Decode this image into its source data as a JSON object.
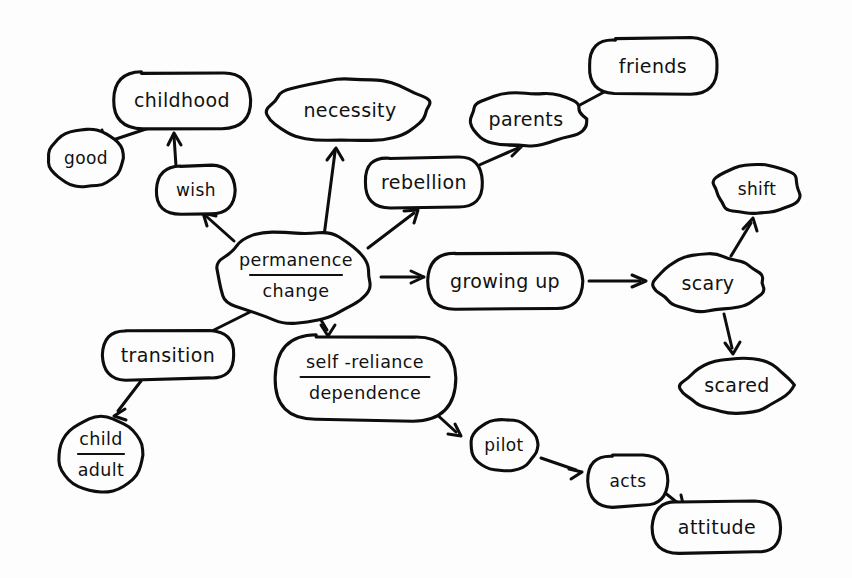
{
  "document": {
    "kind": "hand-drawn-concept-map",
    "title": "permanence / change concept map",
    "background_color": "#fdfdfd",
    "ink_color": "#0d0d0d"
  },
  "nodes": [
    {
      "id": "good",
      "label": "good",
      "label_lines": [
        "good"
      ],
      "shape": "ellipse",
      "cx": 86,
      "cy": 158,
      "rx": 38,
      "ry": 29
    },
    {
      "id": "childhood",
      "label": "childhood",
      "label_lines": [
        "childhood"
      ],
      "shape": "rounded",
      "cx": 182,
      "cy": 100,
      "rx": 68,
      "ry": 28
    },
    {
      "id": "wish",
      "label": "wish",
      "label_lines": [
        "wish"
      ],
      "shape": "rounded",
      "cx": 196,
      "cy": 190,
      "rx": 39,
      "ry": 24
    },
    {
      "id": "necessity",
      "label": "necessity",
      "label_lines": [
        "necessity"
      ],
      "shape": "blob",
      "cx": 350,
      "cy": 110,
      "rx": 79,
      "ry": 33
    },
    {
      "id": "rebellion",
      "label": "rebellion",
      "label_lines": [
        "rebellion"
      ],
      "shape": "rounded",
      "cx": 424,
      "cy": 182,
      "rx": 59,
      "ry": 25
    },
    {
      "id": "parents",
      "label": "parents",
      "label_lines": [
        "parents"
      ],
      "shape": "blob",
      "cx": 526,
      "cy": 119,
      "rx": 59,
      "ry": 27
    },
    {
      "id": "friends",
      "label": "friends",
      "label_lines": [
        "friends"
      ],
      "shape": "rounded",
      "cx": 653,
      "cy": 66,
      "rx": 64,
      "ry": 27
    },
    {
      "id": "permanence-change",
      "label": "permanence / change",
      "label_lines": [
        "permanence",
        "change"
      ],
      "fraction": true,
      "shape": "blob",
      "cx": 296,
      "cy": 276,
      "rx": 79,
      "ry": 46
    },
    {
      "id": "growing-up",
      "label": "growing up",
      "label_lines": [
        "growing up"
      ],
      "shape": "rounded",
      "cx": 505,
      "cy": 281,
      "rx": 77,
      "ry": 28
    },
    {
      "id": "scary",
      "label": "scary",
      "label_lines": [
        "scary"
      ],
      "shape": "blob",
      "cx": 708,
      "cy": 283,
      "rx": 55,
      "ry": 28
    },
    {
      "id": "shift",
      "label": "shift",
      "label_lines": [
        "shift"
      ],
      "shape": "blob",
      "cx": 757,
      "cy": 189,
      "rx": 44,
      "ry": 26
    },
    {
      "id": "scared",
      "label": "scared",
      "label_lines": [
        "scared"
      ],
      "shape": "blob",
      "cx": 737,
      "cy": 385,
      "rx": 55,
      "ry": 27
    },
    {
      "id": "transition",
      "label": "transition",
      "label_lines": [
        "transition"
      ],
      "shape": "rounded",
      "cx": 168,
      "cy": 355,
      "rx": 66,
      "ry": 24
    },
    {
      "id": "child-adult",
      "label": "child / adult",
      "label_lines": [
        "child",
        "adult"
      ],
      "fraction": true,
      "shape": "ellipse",
      "cx": 101,
      "cy": 455,
      "rx": 43,
      "ry": 38
    },
    {
      "id": "self-reliance-dependence",
      "label": "self-reliance / dependence",
      "label_lines": [
        "self -reliance",
        "dependence"
      ],
      "fraction": true,
      "shape": "rounded",
      "cx": 365,
      "cy": 378,
      "rx": 90,
      "ry": 42
    },
    {
      "id": "pilot",
      "label": "pilot",
      "label_lines": [
        "pilot"
      ],
      "shape": "ellipse",
      "cx": 504,
      "cy": 445,
      "rx": 34,
      "ry": 26
    },
    {
      "id": "acts",
      "label": "acts",
      "label_lines": [
        "acts"
      ],
      "shape": "rounded",
      "cx": 628,
      "cy": 481,
      "rx": 40,
      "ry": 25
    },
    {
      "id": "attitude",
      "label": "attitude",
      "label_lines": [
        "attitude"
      ],
      "shape": "rounded",
      "cx": 717,
      "cy": 527,
      "rx": 64,
      "ry": 26
    }
  ],
  "edges": [
    {
      "id": "childhood-to-good",
      "from": "childhood",
      "to": "good",
      "path": "M 152 127 L 104 143",
      "head": "M 104 143 L 93 139 M 104 143 L 102 130"
    },
    {
      "id": "wish-to-childhood",
      "from": "wish",
      "to": "childhood",
      "path": "M 176 166 L 174 136",
      "head": "M 174 133 L 168 145 M 174 133 L 181 145"
    },
    {
      "id": "permanence-to-wish",
      "from": "permanence-change",
      "to": "wish",
      "path": "M 234 241 L 206 216",
      "head": "M 203 213 L 216 216 M 203 213 L 207 226"
    },
    {
      "id": "permanence-to-necessity",
      "from": "permanence-change",
      "to": "necessity",
      "path": "M 324 236 L 335 152",
      "head": "M 336 148 L 327 160 M 336 148 L 343 160"
    },
    {
      "id": "permanence-to-rebellion",
      "from": "permanence-change",
      "to": "rebellion",
      "path": "M 368 248 L 414 213",
      "head": "M 418 210 L 404 211 M 418 210 L 414 223"
    },
    {
      "id": "rebellion-to-parents",
      "from": "rebellion",
      "to": "parents",
      "path": "M 477 166 L 518 148",
      "head": "M 522 146 L 509 145 M 522 146 L 512 156"
    },
    {
      "id": "parents-to-friends",
      "from": "parents",
      "to": "friends",
      "path": "M 578 106 L 619 84",
      "head": "M 623 82 L 610 82 M 623 82 L 613 92"
    },
    {
      "id": "permanence-to-growing",
      "from": "permanence-change",
      "to": "growing-up",
      "path": "M 381 277 L 419 277",
      "head": "M 424 277 L 411 271 M 424 277 L 411 283"
    },
    {
      "id": "growing-to-scary",
      "from": "growing-up",
      "to": "scary",
      "path": "M 589 281 L 640 281",
      "head": "M 646 281 L 632 275 M 646 281 L 632 287"
    },
    {
      "id": "scary-to-shift",
      "from": "scary",
      "to": "shift",
      "path": "M 731 256 L 751 223",
      "head": "M 753 218 L 743 229 M 753 218 L 757 231"
    },
    {
      "id": "scary-to-scared",
      "from": "scary",
      "to": "scared",
      "path": "M 724 314 L 732 348",
      "head": "M 733 354 L 725 343 M 733 354 L 740 342"
    },
    {
      "id": "permanence-to-transition",
      "from": "permanence-change",
      "to": "transition",
      "path": "M 252 311 L 200 337",
      "head": "M 195 340 L 208 338 M 195 340 L 203 350"
    },
    {
      "id": "transition-to-child",
      "from": "transition",
      "to": "child-adult",
      "path": "M 141 381 L 118 411",
      "head": "M 114 416 L 125 409 M 114 416 L 126 420"
    },
    {
      "id": "permanence-to-self",
      "from": "permanence-change",
      "to": "self-reliance-dependence",
      "path": "M 321 320 L 327 330",
      "head": "M 328 336 L 321 325 M 328 336 L 335 325"
    },
    {
      "id": "self-to-pilot",
      "from": "self-reliance-dependence",
      "to": "pilot",
      "path": "M 433 411 L 456 432",
      "head": "M 461 436 L 448 434 M 461 436 L 455 424"
    },
    {
      "id": "pilot-to-acts",
      "from": "pilot",
      "to": "acts",
      "path": "M 541 458 L 576 470",
      "head": "M 582 472 L 569 469 M 582 472 L 571 479"
    },
    {
      "id": "acts-to-attitude",
      "from": "acts",
      "to": "attitude",
      "path": "M 664 492 L 679 504",
      "head": "M 684 508 L 671 506 M 684 508 L 681 495"
    }
  ]
}
